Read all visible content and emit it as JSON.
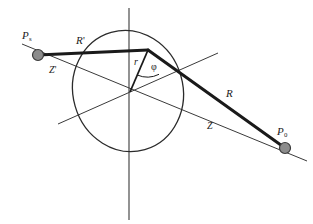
{
  "figure": {
    "kind": "geometry-diagram",
    "width": 313,
    "height": 224,
    "background_color": "#ffffff"
  },
  "colors": {
    "stroke_thin": "#3a3a3a",
    "stroke_thick": "#1a1a1a",
    "ellipse": "#2b2b2b",
    "point_fill": "#8c8c8c",
    "point_stroke": "#3a3a3a",
    "text": "#1a1a1a"
  },
  "labels": {
    "source_point": "P",
    "source_point_sub": "s",
    "observer_point": "P",
    "observer_point_sub": "0",
    "incident_ray": "R",
    "incident_ray_prime": "'",
    "incident_axis": "Z",
    "incident_axis_prime": "'",
    "radius": "r",
    "azimuth_angle": "φ",
    "scattered_ray": "R",
    "scattered_axis": "Z"
  },
  "geometry": {
    "origin": {
      "x": 130,
      "y": 92
    },
    "apex": {
      "x": 148,
      "y": 50
    },
    "source_dot": {
      "x": 38,
      "y": 55,
      "radius": 5.5
    },
    "observer_dot": {
      "x": 285,
      "y": 148,
      "radius": 5.5
    },
    "vertical_axis": {
      "x": 129,
      "y_top": 8,
      "y_bottom": 220
    },
    "z_axis": {
      "x1": 22,
      "y1": 44,
      "x2": 307,
      "y2": 161
    },
    "secondary_axis": {
      "x1": 58,
      "y1": 124,
      "x2": 218,
      "y2": 53
    },
    "ellipse": {
      "cx": 128,
      "cy": 91,
      "rx": 55,
      "ry": 61,
      "rotation_deg": -16
    },
    "angle_arc_radius": 26
  }
}
